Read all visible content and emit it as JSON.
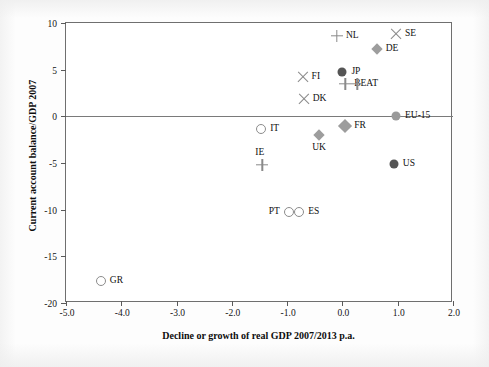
{
  "chart_data": {
    "type": "scatter",
    "title": "",
    "xlabel": "Decline or growth of real GDP 2007/2013 p.a.",
    "ylabel": "Current account balance/GDP 2007",
    "xlim": [
      -5.0,
      2.0
    ],
    "ylim": [
      -20,
      10
    ],
    "xticks": [
      "-5.0",
      "-4.0",
      "-3.0",
      "-2.0",
      "-1.0",
      "0.0",
      "1.0",
      "2.0"
    ],
    "xtick_values": [
      -5.0,
      -4.0,
      -3.0,
      -2.0,
      -1.0,
      0.0,
      1.0,
      2.0
    ],
    "yticks": [
      "10",
      "5",
      "0",
      "-5",
      "-10",
      "-15",
      "-20"
    ],
    "ytick_values": [
      10,
      5,
      0,
      -5,
      -10,
      -15,
      -20
    ],
    "grid": false,
    "legend": "none",
    "zero_line": true,
    "points": [
      {
        "label": "NL",
        "x": -0.1,
        "y": 8.6,
        "marker": "plus",
        "label_pos": "right"
      },
      {
        "label": "SE",
        "x": 0.97,
        "y": 8.8,
        "marker": "x",
        "label_pos": "right"
      },
      {
        "label": "DE",
        "x": 0.62,
        "y": 7.2,
        "marker": "diamond",
        "label_pos": "right"
      },
      {
        "label": "FI",
        "x": -0.72,
        "y": 4.2,
        "marker": "x",
        "label_pos": "right"
      },
      {
        "label": "JP",
        "x": 0.0,
        "y": 4.8,
        "marker": "circle-filled",
        "label_pos": "right"
      },
      {
        "label": "BE",
        "x": 0.05,
        "y": 3.5,
        "marker": "plus",
        "label_pos": "right"
      },
      {
        "label": "AT",
        "x": 0.27,
        "y": 3.5,
        "marker": "plus",
        "label_pos": "right"
      },
      {
        "label": "DK",
        "x": -0.7,
        "y": 1.9,
        "marker": "x",
        "label_pos": "right"
      },
      {
        "label": "EU-15",
        "x": 0.97,
        "y": 0.0,
        "marker": "circle-gray",
        "label_pos": "right"
      },
      {
        "label": "IT",
        "x": -1.47,
        "y": -1.4,
        "marker": "circle-open",
        "label_pos": "right"
      },
      {
        "label": "FR",
        "x": 0.05,
        "y": -1.0,
        "marker": "diamond-big",
        "label_pos": "right"
      },
      {
        "label": "UK",
        "x": -0.42,
        "y": -2.0,
        "marker": "diamond",
        "label_pos": "below"
      },
      {
        "label": "IE",
        "x": -1.45,
        "y": -5.2,
        "marker": "plus",
        "label_pos": "above"
      },
      {
        "label": "US",
        "x": 0.93,
        "y": -5.1,
        "marker": "circle-filled",
        "label_pos": "right"
      },
      {
        "label": "PT",
        "x": -0.97,
        "y": -10.3,
        "marker": "circle-open",
        "label_pos": "left"
      },
      {
        "label": "ES",
        "x": -0.78,
        "y": -10.3,
        "marker": "circle-open",
        "label_pos": "right"
      },
      {
        "label": "GR",
        "x": -4.37,
        "y": -17.6,
        "marker": "circle-open",
        "label_pos": "right"
      }
    ]
  }
}
